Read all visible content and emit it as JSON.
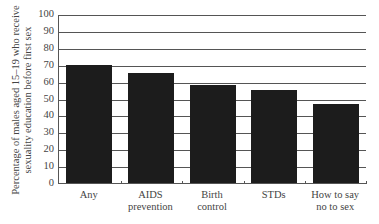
{
  "chart_data": {
    "type": "bar",
    "title": "",
    "xlabel": "",
    "ylabel": "Percentage of males aged 15–19 who receive sexuality education before first sex",
    "ylabel_lines": [
      "Percentage of males aged 15–19 who receive",
      "sexuality education before first sex"
    ],
    "categories": [
      "Any",
      "AIDS prevention",
      "Birth control",
      "STDs",
      "How to say no to sex"
    ],
    "category_lines": [
      [
        "Any"
      ],
      [
        "AIDS",
        "prevention"
      ],
      [
        "Birth",
        "control"
      ],
      [
        "STDs"
      ],
      [
        "How to say",
        "no to sex"
      ]
    ],
    "values": [
      70,
      65,
      58,
      55,
      47
    ],
    "ylim": [
      0,
      100
    ],
    "yticks": [
      0,
      10,
      20,
      30,
      40,
      50,
      60,
      70,
      80,
      90,
      100
    ],
    "grid": true,
    "legend": null,
    "bar_color": "#1c1c1c"
  }
}
